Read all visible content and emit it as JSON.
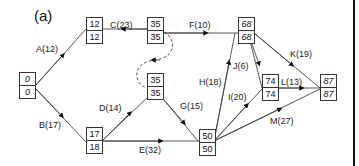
{
  "title": "(a)",
  "nodes": [
    {
      "id": "n1",
      "early": "0",
      "late": "0"
    },
    {
      "id": "n2",
      "early": "12",
      "late": "12"
    },
    {
      "id": "n3",
      "early": "17",
      "late": "18"
    },
    {
      "id": "n4",
      "early": "35",
      "late": "35"
    },
    {
      "id": "n5",
      "early": "35",
      "late": "35"
    },
    {
      "id": "n6",
      "early": "50",
      "late": "50"
    },
    {
      "id": "n7",
      "early": "68",
      "late": "68"
    },
    {
      "id": "n8",
      "early": "74",
      "late": "74"
    },
    {
      "id": "n9",
      "early": "87",
      "late": "87"
    }
  ],
  "activities": [
    {
      "label": "A(12)"
    },
    {
      "label": "B(17)"
    },
    {
      "label": "C(23)"
    },
    {
      "label": "D(14)"
    },
    {
      "label": "E(32)"
    },
    {
      "label": "F(10)"
    },
    {
      "label": "G(15)"
    },
    {
      "label": "H(18)"
    },
    {
      "label": "I(20)"
    },
    {
      "label": "J(6)"
    },
    {
      "label": "K(19)"
    },
    {
      "label": "L(13)"
    },
    {
      "label": "M(27)"
    }
  ]
}
